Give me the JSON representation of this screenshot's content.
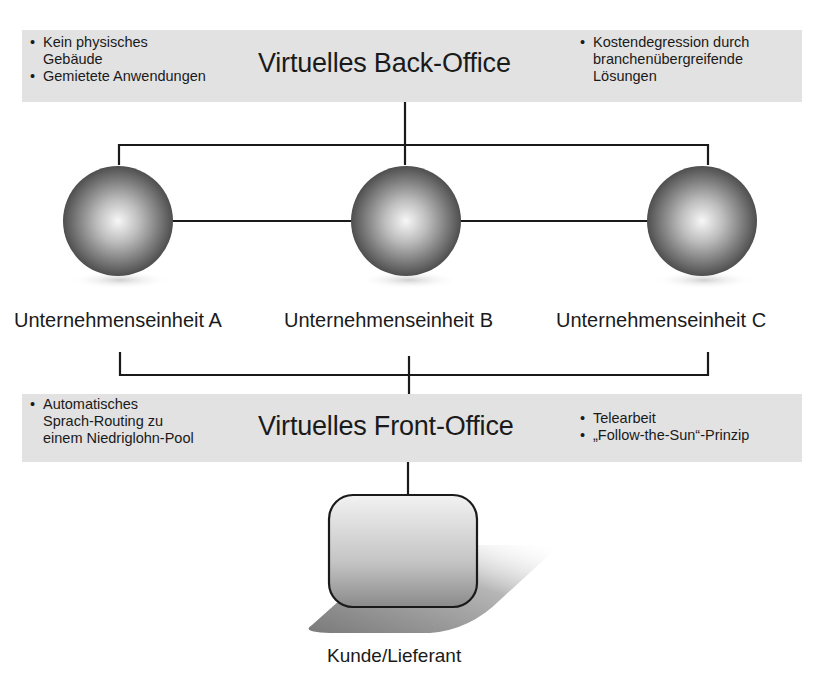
{
  "back_office": {
    "title": "Virtuelles Back-Office",
    "left_bullets": [
      {
        "line1": "Kein physisches",
        "line2": "Gebäude"
      },
      {
        "line1": "Gemietete Anwendungen",
        "line2": ""
      }
    ],
    "right_bullets": [
      {
        "line1": "Kostendegression durch",
        "line2": "branchenübergreifende",
        "line3": "Lösungen"
      }
    ]
  },
  "units": [
    {
      "label": "Unternehmenseinheit A"
    },
    {
      "label": "Unternehmenseinheit B"
    },
    {
      "label": "Unternehmenseinheit C"
    }
  ],
  "front_office": {
    "title": "Virtuelles Front-Office",
    "left_bullets": [
      {
        "line1": "Automatisches",
        "line2": "Sprach-Routing zu",
        "line3": "einem Niedriglohn-Pool"
      }
    ],
    "right_bullets": [
      {
        "line1": "Telearbeit"
      },
      {
        "line1": "„Follow-the-Sun“-Prinzip"
      }
    ]
  },
  "customer": {
    "label": "Kunde/Lieferant"
  },
  "colors": {
    "band": "#e2e2e2",
    "line": "#1a1a1a",
    "sphere_dark": "#3a3a3a",
    "sphere_light": "#f4f4f4"
  }
}
